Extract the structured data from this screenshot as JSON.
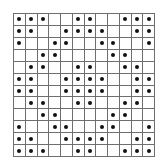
{
  "grid": {
    "rows": 12,
    "cols": 12,
    "line_color": "#6e6e6e",
    "dot_color": "#111111",
    "cells": [
      [
        1,
        1,
        1,
        0,
        0,
        1,
        1,
        0,
        0,
        1,
        1,
        1
      ],
      [
        1,
        1,
        0,
        0,
        1,
        1,
        1,
        1,
        0,
        0,
        1,
        1
      ],
      [
        1,
        0,
        0,
        1,
        1,
        0,
        0,
        1,
        1,
        0,
        0,
        1
      ],
      [
        0,
        0,
        1,
        1,
        0,
        0,
        0,
        0,
        1,
        1,
        0,
        0
      ],
      [
        0,
        1,
        1,
        0,
        0,
        1,
        1,
        0,
        0,
        1,
        1,
        0
      ],
      [
        1,
        1,
        0,
        0,
        1,
        1,
        1,
        1,
        0,
        0,
        1,
        1
      ],
      [
        1,
        1,
        0,
        0,
        1,
        1,
        1,
        1,
        0,
        0,
        1,
        1
      ],
      [
        0,
        1,
        1,
        0,
        0,
        1,
        1,
        0,
        0,
        1,
        1,
        0
      ],
      [
        0,
        0,
        1,
        1,
        0,
        0,
        0,
        0,
        1,
        1,
        0,
        0
      ],
      [
        1,
        0,
        0,
        1,
        1,
        0,
        0,
        1,
        1,
        0,
        0,
        1
      ],
      [
        1,
        1,
        0,
        0,
        1,
        1,
        1,
        1,
        0,
        0,
        1,
        1
      ],
      [
        1,
        1,
        1,
        0,
        0,
        1,
        1,
        0,
        0,
        1,
        1,
        1
      ]
    ]
  }
}
